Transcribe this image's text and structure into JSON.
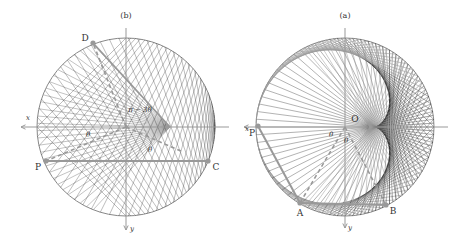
{
  "figure": {
    "orientation": "rotated-180",
    "colors": {
      "background": "#ffffff",
      "circle": "#888888",
      "chords": "#9a9a9a",
      "envelope": "#222222",
      "highlight": "#999999",
      "axes": "#999999",
      "text": "#333333"
    },
    "panels": [
      {
        "id": "a",
        "caption": "(a)",
        "center": [
          345,
          127
        ],
        "radius": 89,
        "chord_count": 72,
        "curve": "cardioid",
        "axis_labels": {
          "x": "x",
          "y": "y"
        },
        "origin_label": "O",
        "points": [
          {
            "label": "P",
            "angle_deg": 180
          },
          {
            "label": "A",
            "angle_deg": 240
          },
          {
            "label": "B",
            "angle_deg": 300
          }
        ],
        "angle_labels": [
          "θ",
          "θ"
        ]
      },
      {
        "id": "b",
        "caption": "(b)",
        "center": [
          126,
          127
        ],
        "radius": 89,
        "chord_count": 36,
        "curve": "nephroid-half",
        "axis_labels": {
          "x": "x",
          "y": "y"
        },
        "points": [
          {
            "label": "P",
            "angle_deg": 157
          },
          {
            "label": "C",
            "angle_deg": 23
          },
          {
            "label": "D",
            "angle_deg": 248
          }
        ],
        "angle_labels": [
          "θ",
          "θ",
          "π − 3θ"
        ]
      }
    ]
  }
}
